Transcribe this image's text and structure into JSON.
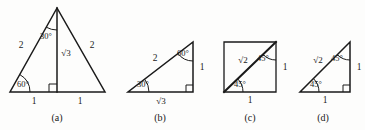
{
  "plate": {
    "background_color": "#fdfdfc",
    "stroke_color": "#1a1a1a",
    "label_color": "#1a1a1a",
    "width": 365,
    "height": 130
  },
  "figures": [
    {
      "caption": "(a)",
      "caption_x": 57,
      "caption_y": 118,
      "shape": "equilateral-triangle-with-altitude",
      "vertices": {
        "apex": [
          57,
          8
        ],
        "left": [
          10,
          92
        ],
        "right": [
          105,
          92
        ]
      },
      "altitude_foot": [
        57,
        92
      ],
      "right_angle_marker": {
        "x": 57,
        "y": 92,
        "size": 8,
        "side": "left"
      },
      "angle_arcs": [
        {
          "label": "30°",
          "vertex": [
            57,
            8
          ],
          "radius": 22,
          "label_x": 46,
          "label_y": 36
        },
        {
          "label": "60°",
          "vertex": [
            10,
            92
          ],
          "radius": 20,
          "label_x": 23,
          "label_y": 84
        }
      ],
      "side_labels": [
        {
          "text": "2",
          "x": 21,
          "y": 46
        },
        {
          "text": "2",
          "x": 92,
          "y": 46
        },
        {
          "text": "√3",
          "x": 66,
          "y": 53
        },
        {
          "text": "1",
          "x": 34,
          "y": 102
        },
        {
          "text": "1",
          "x": 80,
          "y": 102
        }
      ]
    },
    {
      "caption": "(b)",
      "caption_x": 160,
      "caption_y": 118,
      "shape": "right-triangle-30-60-90",
      "vertices": {
        "left": [
          128,
          92
        ],
        "bottom_right": [
          193,
          92
        ],
        "top_right": [
          193,
          42
        ]
      },
      "right_angle_marker": {
        "x": 193,
        "y": 92,
        "size": 7,
        "side": "left"
      },
      "angle_arcs": [
        {
          "label": "30°",
          "vertex": [
            128,
            92
          ],
          "radius": 21,
          "label_x": 143,
          "label_y": 84
        },
        {
          "label": "60°",
          "vertex": [
            193,
            42
          ],
          "radius": 19,
          "label_x": 183,
          "label_y": 53
        }
      ],
      "side_labels": [
        {
          "text": "2",
          "x": 155,
          "y": 59
        },
        {
          "text": "1",
          "x": 202,
          "y": 68
        },
        {
          "text": "√3",
          "x": 161,
          "y": 101
        }
      ]
    },
    {
      "caption": "(c)",
      "caption_x": 250,
      "caption_y": 118,
      "shape": "square-with-diagonal",
      "vertices": {
        "bottom_left": [
          224,
          92
        ],
        "bottom_right": [
          276,
          92
        ],
        "top_right": [
          276,
          42
        ],
        "top_left": [
          224,
          42
        ]
      },
      "diagonal": [
        [
          224,
          92
        ],
        [
          276,
          42
        ]
      ],
      "angle_arcs": [
        {
          "label": "45°",
          "vertex": [
            224,
            92
          ],
          "radius": 19,
          "label_x": 240,
          "label_y": 84
        },
        {
          "label": "45°",
          "vertex": [
            276,
            42
          ],
          "radius": 18,
          "label_x": 263,
          "label_y": 58
        }
      ],
      "side_labels": [
        {
          "text": "√2",
          "x": 243,
          "y": 60
        },
        {
          "text": "1",
          "x": 285,
          "y": 68
        },
        {
          "text": "1",
          "x": 250,
          "y": 101
        }
      ]
    },
    {
      "caption": "(d)",
      "caption_x": 323,
      "caption_y": 118,
      "shape": "right-triangle-45-45-90",
      "vertices": {
        "left": [
          300,
          92
        ],
        "bottom_right": [
          350,
          92
        ],
        "top_right": [
          350,
          42
        ]
      },
      "right_angle_marker": {
        "x": 350,
        "y": 92,
        "size": 7,
        "side": "left"
      },
      "angle_arcs": [
        {
          "label": "45°",
          "vertex": [
            300,
            92
          ],
          "radius": 19,
          "label_x": 316,
          "label_y": 84
        },
        {
          "label": "45°",
          "vertex": [
            350,
            42
          ],
          "radius": 18,
          "label_x": 337,
          "label_y": 58
        }
      ],
      "side_labels": [
        {
          "text": "√2",
          "x": 318,
          "y": 60
        },
        {
          "text": "1",
          "x": 359,
          "y": 68
        },
        {
          "text": "1",
          "x": 325,
          "y": 101
        }
      ]
    }
  ]
}
